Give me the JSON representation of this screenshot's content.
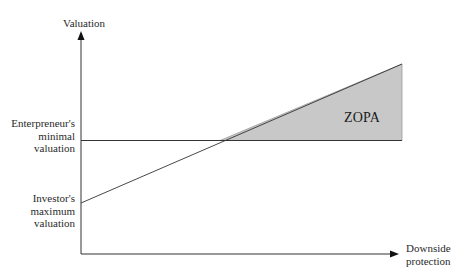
{
  "diagram": {
    "y_axis_label": "Valuation",
    "x_axis_label_line1": "Downside",
    "x_axis_label_line2": "protection",
    "entrepreneur_label_line1": "Enterpreneur's",
    "entrepreneur_label_line2": "minimal",
    "entrepreneur_label_line3": "valuation",
    "investor_label_line1": "Investor's",
    "investor_label_line2": "maximum",
    "investor_label_line3": "valuation",
    "region_label": "ZOPA",
    "colors": {
      "axis": "#000000",
      "line": "#333333",
      "region_fill": "#c8c8c8",
      "region_stroke": "#9a9a9a"
    }
  }
}
